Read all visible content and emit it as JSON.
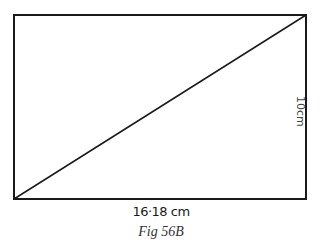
{
  "figure": {
    "caption": "Fig 56B",
    "shape": "rectangle with diagonal",
    "width_label": "16·18 cm",
    "height_label": "10cm",
    "colors": {
      "stroke": "#1a1a1a",
      "background": "#ffffff"
    }
  }
}
